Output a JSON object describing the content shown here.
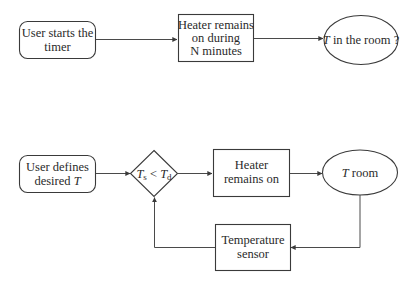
{
  "diagram": {
    "top_flow": {
      "start": {
        "lines": [
          "User starts the",
          "timer"
        ]
      },
      "process": {
        "lines": [
          "Heater remains",
          "on during",
          "N minutes"
        ]
      },
      "result": {
        "var": "T",
        "text": " in the room ?"
      }
    },
    "bottom_flow": {
      "start": {
        "line1": "User defines",
        "line2_text": "desired ",
        "line2_var": "T"
      },
      "decision": {
        "left_var": "T",
        "left_sub": "s",
        "op": " < ",
        "right_var": "T",
        "right_sub": "d"
      },
      "process": {
        "lines": [
          "Heater",
          "remains on"
        ]
      },
      "result": {
        "var": "T",
        "text": " room"
      },
      "feedback": {
        "lines": [
          "Temperature",
          "sensor"
        ]
      }
    },
    "colors": {
      "stroke": "#3a3a3a",
      "text": "#2a2a2a",
      "background": "#ffffff"
    }
  }
}
